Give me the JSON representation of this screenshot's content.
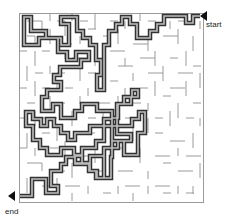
{
  "puzzle": {
    "type": "maze",
    "start_label": "start",
    "end_label": "end",
    "colors": {
      "wall": "#9a9a9a",
      "path_outer": "#333333",
      "path_inner": "#bdbdbd",
      "arrow": "#111111"
    }
  }
}
